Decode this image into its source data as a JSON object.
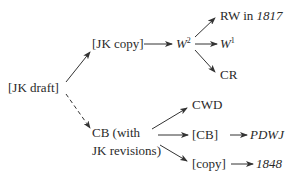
{
  "diagram": {
    "type": "stemma",
    "nodes": {
      "jk_draft": "[JK draft]",
      "jk_copy": "[JK copy]",
      "w2_base": "W",
      "w2_sup": "2",
      "rw_prefix": "RW in ",
      "rw_year": "1817",
      "w1_base": "W",
      "w1_sup": "1",
      "cr": "CR",
      "cb_line1": "CB (with",
      "cb_line2": "JK revisions)",
      "cwd": "CWD",
      "cb_bracket": "[CB]",
      "pdwj": "PDWJ",
      "copy": "[copy]",
      "year_1848": "1848"
    },
    "edges": [
      {
        "from": "[JK draft]",
        "to": "[JK copy]",
        "style": "solid"
      },
      {
        "from": "[JK draft]",
        "to": "CB (with JK revisions)",
        "style": "dashed"
      },
      {
        "from": "[JK copy]",
        "to": "W2",
        "style": "solid"
      },
      {
        "from": "W2",
        "to": "RW in 1817",
        "style": "solid"
      },
      {
        "from": "W2",
        "to": "W1",
        "style": "solid"
      },
      {
        "from": "W2",
        "to": "CR",
        "style": "solid"
      },
      {
        "from": "CB (with JK revisions)",
        "to": "CWD",
        "style": "solid"
      },
      {
        "from": "CB (with JK revisions)",
        "to": "[CB]",
        "style": "solid"
      },
      {
        "from": "CB (with JK revisions)",
        "to": "[copy]",
        "style": "solid"
      },
      {
        "from": "[CB]",
        "to": "PDWJ",
        "style": "solid"
      },
      {
        "from": "[copy]",
        "to": "1848",
        "style": "solid"
      }
    ]
  }
}
